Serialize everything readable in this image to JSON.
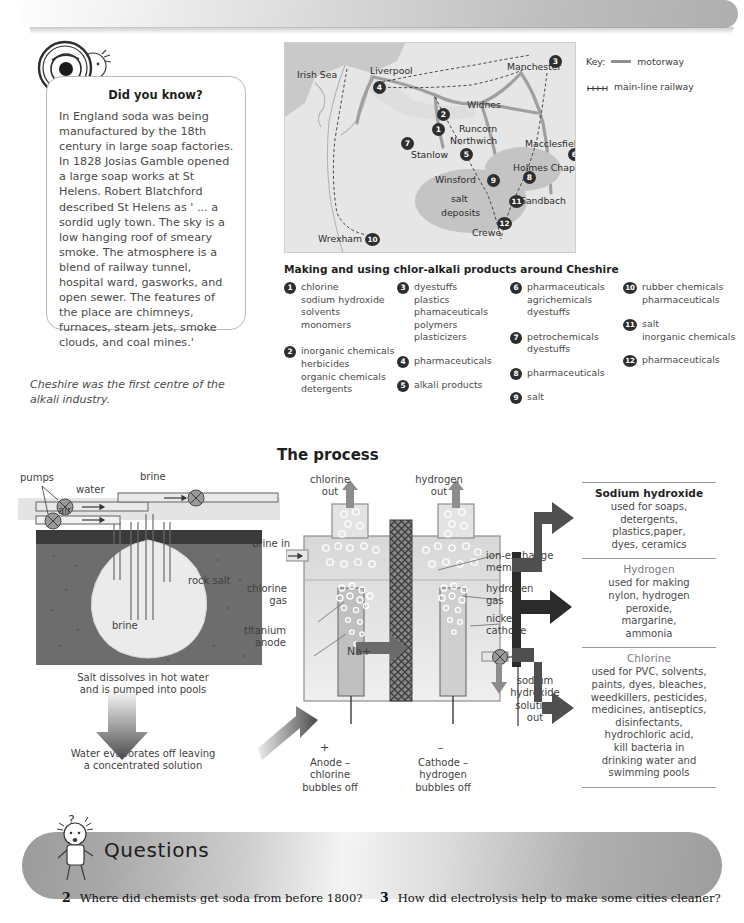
{
  "top_banner": {
    "decorative": true
  },
  "did_you_know": {
    "icon": "magnifier-cartoon",
    "title": "Did you know?",
    "body": "In England soda was being manufactured by the 18th century in large soap factories. In 1828 Josias Gamble opened a large soap works at St Helens. Robert Blatchford described St Helens as ' ... a sordid ugly town. The sky is a low hanging roof of smeary smoke. The atmosphere is a blend of railway tunnel, hospital ward, gasworks, and open sewer. The features of the place are chimneys, furnaces, steam jets, smoke clouds, and coal mines.'"
  },
  "map_caption": "Cheshire was the first centre of the alkali industry.",
  "map": {
    "sea_label": "Irish Sea",
    "salt_label_line1": "salt",
    "salt_label_line2": "deposits",
    "places": [
      {
        "name": "Liverpool",
        "x": 85,
        "y": 22
      },
      {
        "name": "Manchester",
        "x": 222,
        "y": 18
      },
      {
        "name": "Widnes",
        "x": 182,
        "y": 56
      },
      {
        "name": "Runcorn",
        "x": 174,
        "y": 80
      },
      {
        "name": "Northwich",
        "x": 165,
        "y": 92
      },
      {
        "name": "Macclesfield",
        "x": 240,
        "y": 95
      },
      {
        "name": "Stanlow",
        "x": 126,
        "y": 106
      },
      {
        "name": "Holmes Chapel",
        "x": 228,
        "y": 119
      },
      {
        "name": "Winsford",
        "x": 156,
        "y": 133
      },
      {
        "name": "Sandbach",
        "x": 235,
        "y": 155
      },
      {
        "name": "Crewe",
        "x": 187,
        "y": 184
      },
      {
        "name": "Wrexham",
        "x": 37,
        "y": 192
      }
    ],
    "markers": [
      {
        "n": "3",
        "x": 264,
        "y": 12
      },
      {
        "n": "4",
        "x": 88,
        "y": 38
      },
      {
        "n": "2",
        "x": 152,
        "y": 65
      },
      {
        "n": "1",
        "x": 147,
        "y": 80
      },
      {
        "n": "7",
        "x": 116,
        "y": 94
      },
      {
        "n": "5",
        "x": 175,
        "y": 105
      },
      {
        "n": "6",
        "x": 285,
        "y": 105
      },
      {
        "n": "8",
        "x": 238,
        "y": 128
      },
      {
        "n": "9",
        "x": 202,
        "y": 131
      },
      {
        "n": "11",
        "x": 226,
        "y": 152
      },
      {
        "n": "12",
        "x": 214,
        "y": 174
      },
      {
        "n": "10",
        "x": 82,
        "y": 190
      }
    ],
    "key": {
      "label": "Key:",
      "motorway": "motorway",
      "railway": "main-line railway"
    }
  },
  "product_list": {
    "title": "Making and using chlor-alkali products around Cheshire",
    "items": [
      {
        "n": "1",
        "terms": [
          "chlorine",
          "sodium hydroxide",
          "solvents",
          "monomers"
        ]
      },
      {
        "n": "2",
        "terms": [
          "inorganic chemicals",
          "herbicides",
          "organic chemicals",
          "detergents"
        ]
      },
      {
        "n": "3",
        "terms": [
          "dyestuffs",
          "plastics",
          "phamaceuticals",
          "polymers",
          "plasticizers"
        ]
      },
      {
        "n": "4",
        "terms": [
          "pharmaceuticals"
        ]
      },
      {
        "n": "5",
        "terms": [
          "alkali products"
        ]
      },
      {
        "n": "6",
        "terms": [
          "pharmaceuticals",
          "agrichemicals",
          "dyestuffs"
        ]
      },
      {
        "n": "7",
        "terms": [
          "petrochemicals",
          "dyestuffs"
        ]
      },
      {
        "n": "8",
        "terms": [
          "pharmaceuticals"
        ]
      },
      {
        "n": "9",
        "terms": [
          "salt"
        ]
      },
      {
        "n": "10",
        "terms": [
          "rubber chemicals",
          "pharmaceuticals"
        ]
      },
      {
        "n": "11",
        "terms": [
          "salt",
          "inorganic chemicals"
        ]
      },
      {
        "n": "12",
        "terms": [
          "pharmaceuticals"
        ]
      }
    ]
  },
  "process": {
    "title": "The process",
    "brine_labels": {
      "pumps": "pumps",
      "water": "water",
      "brine_top": "brine",
      "air": "air",
      "rock_salt": "rock salt",
      "brine_cavity": "brine"
    },
    "step_captions": [
      "Salt dissolves in hot water\nand is pumped  into pools",
      "Water evaporates off leaving\na concentrated solution"
    ],
    "cell_labels": {
      "chlorine_out": "chlorine\nout",
      "hydrogen_out": "hydrogen\nout",
      "brine_in": "brine in",
      "chlorine_gas": "chlorine\ngas",
      "titanium_anode": "titanium\nanode",
      "ion_exchange_membrane": "ion-exchange\nmembrane",
      "hydrogen_gas": "hydrogen\ngas",
      "nickel_cathode": "nickel\ncathode",
      "sodium_ion": "Na+",
      "sodium_hydroxide_out": "sodium\nhydroxide\nsolution\nout",
      "anode_sign": "+",
      "cathode_sign": "–",
      "anode_caption": "Anode –\nchlorine\nbubbles off",
      "cathode_caption": "Cathode –\nhydrogen\nbubbles off"
    }
  },
  "products_panel": [
    {
      "name": "Sodium hydroxide",
      "uses": "used for soaps,\ndetergents,\nplastics,paper,\ndyes, ceramics"
    },
    {
      "name": "Hydrogen",
      "uses": "used for making\nnylon, hydrogen\nperoxide,\nmargarine,\nammonia"
    },
    {
      "name": "Chlorine",
      "uses": "used for PVC, solvents,\npaints, dyes, bleaches,\nweedkillers, pesticides,\nmedicines, antiseptics,\ndisinfectants,\nhydrochloric acid,\nkill bacteria in\ndrinking water and\nswimming pools"
    }
  ],
  "questions": {
    "heading": "Questions",
    "icon": "scientist-cartoon",
    "items": [
      {
        "num": "2",
        "text": "Where did chemists get soda from before 1800?"
      },
      {
        "num": "3",
        "text": "How did electrolysis help to make some cities cleaner?"
      }
    ]
  }
}
